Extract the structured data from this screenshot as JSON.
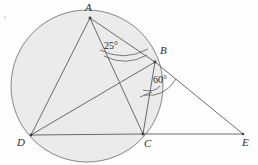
{
  "figure": {
    "type": "circle-geometry-diagram",
    "canvas": {
      "width": 258,
      "height": 165
    },
    "background_color": "#fefefe",
    "stroke_color": "#5a5a5a",
    "circle_fill_color": "#ebebeb",
    "circle_stroke_color": "#707070"
  },
  "circle": {
    "name": "circumscribed-circle",
    "cx": 87,
    "cy": 86,
    "r": 76
  },
  "points": [
    {
      "id": "A",
      "label": "A",
      "x": 90,
      "y": 18,
      "label_x": 85,
      "label_y": 3
    },
    {
      "id": "B",
      "label": "B",
      "x": 155,
      "y": 62,
      "label_x": 160,
      "label_y": 46
    },
    {
      "id": "C",
      "label": "C",
      "x": 143,
      "y": 134,
      "label_x": 144,
      "label_y": 139
    },
    {
      "id": "D",
      "label": "D",
      "x": 31,
      "y": 135,
      "label_x": 17,
      "label_y": 138
    },
    {
      "id": "E",
      "label": "E",
      "x": 243,
      "y": 134,
      "label_x": 243,
      "label_y": 138
    }
  ],
  "segments": [
    {
      "name": "segment-AD",
      "from": "A",
      "to": "D"
    },
    {
      "name": "segment-AC",
      "from": "A",
      "to": "C"
    },
    {
      "name": "segment-AB",
      "from": "A",
      "to": "B"
    },
    {
      "name": "segment-DB",
      "from": "D",
      "to": "B"
    },
    {
      "name": "segment-DC",
      "from": "D",
      "to": "C"
    },
    {
      "name": "segment-BC",
      "from": "B",
      "to": "C"
    },
    {
      "name": "segment-BE",
      "from": "B",
      "to": "E"
    },
    {
      "name": "segment-CE",
      "from": "C",
      "to": "E"
    }
  ],
  "angles": [
    {
      "id": "angle-BAC",
      "vertex": "A",
      "value": "25°",
      "label_x": 104,
      "label_y": 42,
      "arc_path": "M 104 56 Q 126 66 146 55",
      "arc2_path": "M 101 52 Q 124 63 147 51"
    },
    {
      "id": "angle-CBE",
      "vertex": "B",
      "value": "60°",
      "label_x": 153,
      "label_y": 76,
      "arc_path": "M 144 94 Q 163 98 175 80",
      "tick_path": "M 141 96 L 152 92"
    }
  ],
  "title": ""
}
